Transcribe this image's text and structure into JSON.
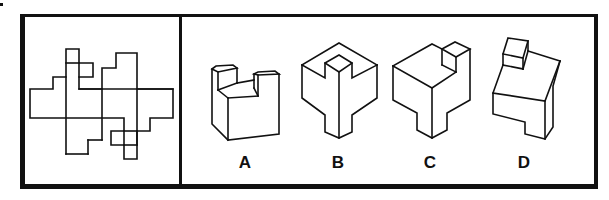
{
  "puzzle": {
    "type": "cube net folding question",
    "net_panel": {
      "description": "Unfolded net of a 3D shape (question figure)"
    },
    "options": [
      {
        "label": "A",
        "description": "Block with two raised posts and a notch between"
      },
      {
        "label": "B",
        "description": "Cube with corner notch and T-shaped base"
      },
      {
        "label": "C",
        "description": "Cube with small cube on top corner and notched base"
      },
      {
        "label": "D",
        "description": "Slab with small cube on top and notched front base"
      }
    ]
  },
  "colors": {
    "line": "#111111",
    "background": "#ffffff"
  }
}
